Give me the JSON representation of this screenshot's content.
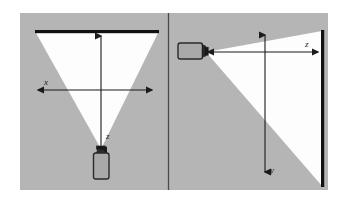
{
  "figure": {
    "name": "camera-projection-geometry-diagram",
    "panel_count": 2,
    "colors": {
      "background": "#ffffff",
      "panel_fill": "#b5b5b5",
      "beam_fill": "#fefefe",
      "screen_stroke": "#111111",
      "divider_stroke": "#4a4a4a",
      "axis_stroke": "#1b1b1b",
      "device_body_fill": "#a9a9a9",
      "device_stroke": "#2a2a2a"
    }
  },
  "panels": [
    {
      "id": "left-panel",
      "name": "top-view-panel",
      "view": "top view",
      "device": {
        "name": "camera-device",
        "orientation": "vertical-up",
        "position": "bottom-center"
      },
      "screen": {
        "name": "projection-screen",
        "orientation": "horizontal",
        "position": "top"
      },
      "beam": {
        "name": "projection-beam",
        "shape": "triangle",
        "direction": "upward"
      },
      "axes": [
        {
          "id": "left-x-axis",
          "label": "x",
          "orientation": "horizontal",
          "arrowheads": "both"
        },
        {
          "id": "left-z-axis",
          "label": "z",
          "orientation": "vertical",
          "arrowheads": "both"
        }
      ]
    },
    {
      "id": "right-panel",
      "name": "side-view-panel",
      "view": "side view",
      "device": {
        "name": "camera-device",
        "orientation": "horizontal-right",
        "position": "upper-left"
      },
      "screen": {
        "name": "projection-screen",
        "orientation": "vertical",
        "position": "right"
      },
      "beam": {
        "name": "projection-beam",
        "shape": "triangle",
        "direction": "rightward"
      },
      "axes": [
        {
          "id": "right-z-axis",
          "label": "z",
          "orientation": "horizontal",
          "arrowheads": "both"
        },
        {
          "id": "right-y-axis",
          "label": "y",
          "orientation": "vertical",
          "arrowheads": "both"
        }
      ]
    }
  ],
  "labels": {
    "left_x": "x",
    "left_z": "z",
    "right_z": "z",
    "right_y": "y"
  }
}
